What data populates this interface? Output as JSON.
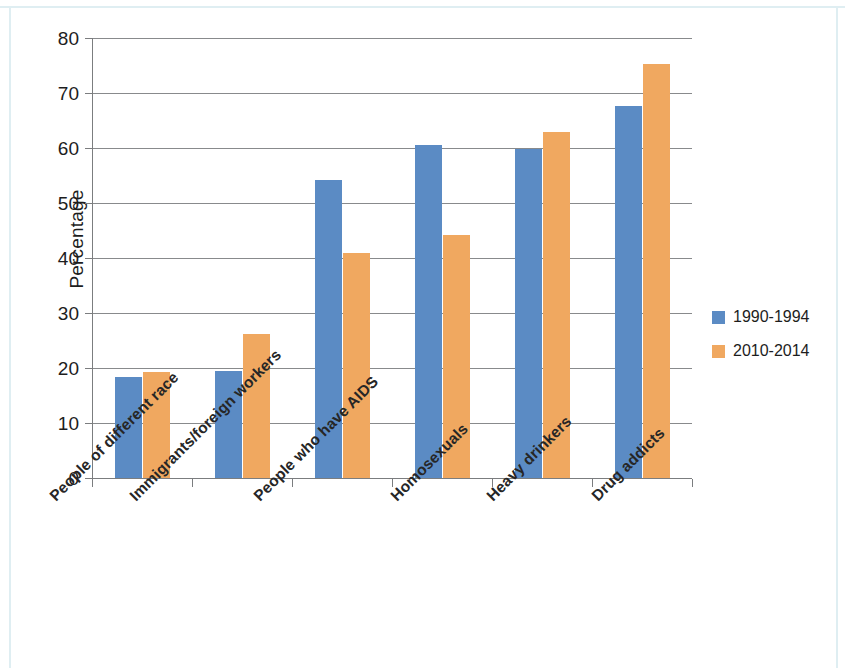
{
  "chart_data": {
    "type": "bar",
    "title": "",
    "xlabel": "",
    "ylabel": "Percentage",
    "ylim": [
      0,
      80
    ],
    "ytick_values": [
      0,
      10,
      20,
      30,
      40,
      50,
      60,
      70,
      80
    ],
    "ytick_labels": [
      "0",
      "10",
      "20",
      "30",
      "40",
      "50",
      "60",
      "70",
      "80"
    ],
    "grid": true,
    "grid_axis": "y",
    "legend_position": "right",
    "categories": [
      "People of different race",
      "Immigrants/foreign workers",
      "People who have AIDS",
      "Homosexuals",
      "Heavy drinkers",
      "Drug addicts"
    ],
    "series": [
      {
        "name": "1990-1994",
        "color": "#5b8bc4",
        "values": [
          18.3,
          19.4,
          54.1,
          60.5,
          59.8,
          67.6
        ]
      },
      {
        "name": "2010-2014",
        "color": "#f0a860",
        "values": [
          19.3,
          26.1,
          41.0,
          44.1,
          63.0,
          75.2
        ]
      }
    ]
  }
}
